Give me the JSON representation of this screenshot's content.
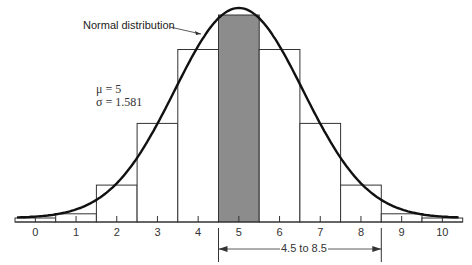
{
  "chart_data": {
    "type": "bar",
    "title": "",
    "xlabel": "",
    "ylabel": "",
    "categories": [
      "0",
      "1",
      "2",
      "3",
      "4",
      "5",
      "6",
      "7",
      "8",
      "9",
      "10"
    ],
    "values": [
      0.001,
      0.0098,
      0.0439,
      0.1172,
      0.2051,
      0.2461,
      0.2051,
      0.1172,
      0.0439,
      0.0098,
      0.001
    ],
    "highlighted_bar": "5",
    "highlight_color": "#8c8c8c",
    "overlay_curve": {
      "label": "Normal distribution",
      "mu": 5,
      "sigma": 1.581
    },
    "annotations": {
      "curve_label": "Normal distribution",
      "mu_text": "μ = 5",
      "sigma_text": "σ = 1.581",
      "range_text": "4.5 to 8.5",
      "range": [
        4.5,
        8.5
      ]
    },
    "xlim": [
      -0.5,
      10.5
    ],
    "grid": false,
    "legend": "none"
  },
  "labels": {
    "curve_label": "Normal distribution",
    "mu_text": "μ = 5",
    "sigma_text": "σ = 1.581",
    "range_text": "4.5 to 8.5",
    "ticks": [
      "0",
      "1",
      "2",
      "3",
      "4",
      "5",
      "6",
      "7",
      "8",
      "9",
      "10"
    ]
  }
}
